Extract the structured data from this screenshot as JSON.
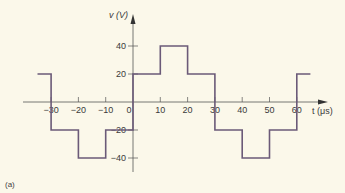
{
  "chart_data": {
    "type": "line",
    "style": "step",
    "title": "",
    "xlabel": "t (μs)",
    "ylabel": "v (V)",
    "caption": "(a)",
    "xlim": [
      -35,
      65
    ],
    "ylim": [
      -50,
      50
    ],
    "x_ticks": [
      -30,
      -20,
      -10,
      0,
      10,
      20,
      30,
      40,
      50,
      60
    ],
    "x_tick_labels": [
      "−30",
      "−20",
      "−10",
      "0",
      "10",
      "20",
      "30",
      "40",
      "50",
      "60"
    ],
    "y_ticks": [
      40,
      20,
      -20,
      -40
    ],
    "y_tick_labels": [
      "40",
      "20",
      "−20",
      "−40"
    ],
    "grid": false,
    "line_color": "#6b5a78",
    "series": [
      {
        "name": "v(t)",
        "x": [
          -35,
          -30,
          -30,
          -20,
          -20,
          -10,
          -10,
          0,
          0,
          10,
          10,
          20,
          20,
          30,
          30,
          40,
          40,
          50,
          50,
          60,
          60,
          65
        ],
        "values": [
          20,
          20,
          -20,
          -20,
          -40,
          -40,
          -20,
          -20,
          20,
          20,
          40,
          40,
          20,
          20,
          -20,
          -20,
          -40,
          -40,
          -20,
          -20,
          20,
          20
        ]
      }
    ]
  }
}
